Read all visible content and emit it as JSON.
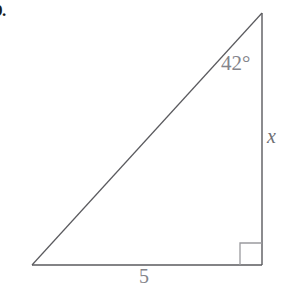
{
  "figure": {
    "problem_number": "9.",
    "shape": "right-triangle",
    "background_color": "#ffffff",
    "stroke_color": "#5a5a5e",
    "text_color": "#84848a",
    "vertices": {
      "bottom_left": [
        32,
        265
      ],
      "bottom_right": [
        262,
        265
      ],
      "apex": [
        262,
        13
      ]
    },
    "right_angle_marker": {
      "corner": "bottom-right",
      "size": 22,
      "x": 240,
      "y": 243
    },
    "labels": {
      "angle": "42°",
      "vertical_side": "x",
      "horizontal_side": "5"
    }
  }
}
